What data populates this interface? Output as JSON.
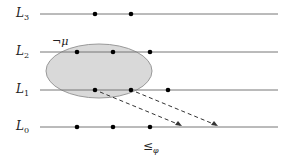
{
  "levels": [
    {
      "name": "L",
      "sub": "3",
      "y": 14,
      "dots": [
        95,
        131
      ]
    },
    {
      "name": "L",
      "sub": "2",
      "y": 52,
      "dots": [
        77,
        113,
        150
      ]
    },
    {
      "name": "L",
      "sub": "1",
      "y": 90,
      "dots": [
        95,
        131,
        168
      ]
    },
    {
      "name": "L",
      "sub": "0",
      "y": 127,
      "dots": [
        77,
        113,
        150
      ]
    }
  ],
  "ellipse_label": "¬μ",
  "order_label": "≤",
  "order_sub": "φ",
  "colors": {
    "line": "#777777",
    "dot": "#000000",
    "ellipse_fill": "#d9d9d9",
    "ellipse_stroke": "#999999",
    "arrow": "#333333"
  }
}
